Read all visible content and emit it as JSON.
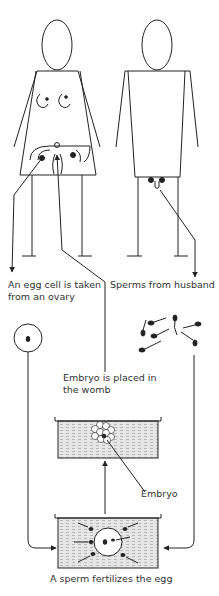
{
  "labels": {
    "egg_taken_line1": "An egg cell is taken",
    "egg_taken_line2": "from an ovary",
    "sperms": "Sperms from husband",
    "embryo_placed_line1": "Embryo is placed in",
    "embryo_placed_line2": "the womb",
    "embryo": "Embryo",
    "fertilizes": "A sperm fertilizes the egg"
  },
  "colors": {
    "line": "#222222",
    "dish_fill": "#d9d9d9",
    "background": "#ffffff"
  }
}
